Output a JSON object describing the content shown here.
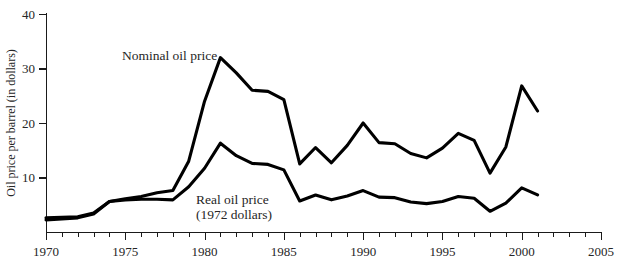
{
  "chart_data": {
    "type": "line",
    "title": "",
    "xlabel": "",
    "ylabel": "Oil price per barrel (in dollars)",
    "xlim": [
      1970,
      2005
    ],
    "ylim": [
      0,
      40
    ],
    "ytick_labels": [
      "0",
      "10",
      "20",
      "30",
      "40"
    ],
    "yticks": [
      0,
      10,
      20,
      30,
      40
    ],
    "xtick_labels": [
      "1970",
      "1975",
      "1980",
      "1985",
      "1990",
      "1995",
      "2000",
      "2005"
    ],
    "xticks": [
      1970,
      1975,
      1980,
      1985,
      1990,
      1995,
      2000,
      2005
    ],
    "xtick_minor_step": 1,
    "grid": false,
    "legend_position": "inline-annotation",
    "x": [
      1970,
      1971,
      1972,
      1973,
      1974,
      1975,
      1976,
      1977,
      1978,
      1979,
      1980,
      1981,
      1982,
      1983,
      1984,
      1985,
      1986,
      1987,
      1988,
      1989,
      1990,
      1991,
      1992,
      1993,
      1994,
      1995,
      1996,
      1997,
      1998,
      1999,
      2000,
      2001
    ],
    "series": [
      {
        "name": "Nominal oil price",
        "label": "Nominal oil price",
        "color": "#000000",
        "values": [
          2.2,
          2.4,
          2.6,
          3.3,
          5.6,
          6.1,
          6.5,
          7.2,
          7.6,
          13.0,
          24.0,
          32.0,
          29.2,
          26.0,
          25.8,
          24.3,
          12.5,
          15.5,
          12.7,
          15.9,
          20.0,
          16.4,
          16.2,
          14.4,
          13.6,
          15.4,
          18.1,
          16.8,
          10.8,
          15.6,
          26.8,
          22.2
        ]
      },
      {
        "name": "Real oil price (1972 dollars)",
        "label": "Real oil price",
        "sublabel": "(1972 dollars)",
        "color": "#000000",
        "values": [
          2.6,
          2.7,
          2.8,
          3.5,
          5.6,
          5.9,
          6.0,
          6.0,
          5.9,
          8.3,
          11.7,
          16.3,
          14.0,
          12.6,
          12.4,
          11.4,
          5.7,
          6.8,
          5.9,
          6.6,
          7.6,
          6.4,
          6.3,
          5.5,
          5.2,
          5.6,
          6.5,
          6.2,
          3.8,
          5.3,
          8.1,
          6.8
        ]
      }
    ]
  },
  "annotations": {
    "nominal_label": "Nominal oil price",
    "real_label": "Real oil price",
    "real_sublabel": "(1972 dollars)"
  }
}
